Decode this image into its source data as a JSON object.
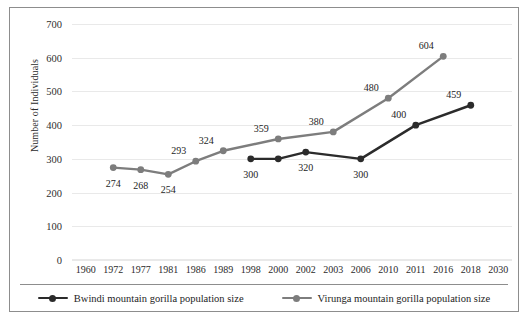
{
  "chart_data": {
    "type": "line",
    "title": "",
    "xlabel": "",
    "ylabel": "Number of Individuals",
    "categories": [
      "1960",
      "1972",
      "1977",
      "1981",
      "1986",
      "1989",
      "1998",
      "2000",
      "2002",
      "2003",
      "2006",
      "2010",
      "2011",
      "2016",
      "2018",
      "2030"
    ],
    "ylim": [
      0,
      700
    ],
    "ytick_step": 100,
    "yticks": [
      "700",
      "600",
      "500",
      "400",
      "300",
      "200",
      "100",
      "0"
    ],
    "grid": true,
    "legend_position": "bottom",
    "series": [
      {
        "name": "Bwindi mountain gorilla population size",
        "color": "#2b2b2b",
        "points": [
          {
            "x": "1998",
            "y": 300,
            "label": "300",
            "label_pos": "below"
          },
          {
            "x": "2000",
            "y": 300,
            "label": "",
            "label_pos": "below"
          },
          {
            "x": "2002",
            "y": 320,
            "label": "320",
            "label_pos": "below"
          },
          {
            "x": "2006",
            "y": 300,
            "label": "300",
            "label_pos": "below"
          },
          {
            "x": "2011",
            "y": 400,
            "label": "400",
            "label_pos": "above-left"
          },
          {
            "x": "2018",
            "y": 459,
            "label": "459",
            "label_pos": "above-left"
          }
        ]
      },
      {
        "name": "Virunga mountain gorilla population size",
        "color": "#7d7d7d",
        "points": [
          {
            "x": "1972",
            "y": 274,
            "label": "274",
            "label_pos": "below"
          },
          {
            "x": "1977",
            "y": 268,
            "label": "268",
            "label_pos": "below"
          },
          {
            "x": "1981",
            "y": 254,
            "label": "254",
            "label_pos": "below"
          },
          {
            "x": "1986",
            "y": 293,
            "label": "293",
            "label_pos": "above-left"
          },
          {
            "x": "1989",
            "y": 324,
            "label": "324",
            "label_pos": "above-left"
          },
          {
            "x": "2000",
            "y": 359,
            "label": "359",
            "label_pos": "above-left"
          },
          {
            "x": "2003",
            "y": 380,
            "label": "380",
            "label_pos": "above-left"
          },
          {
            "x": "2010",
            "y": 480,
            "label": "480",
            "label_pos": "above-left"
          },
          {
            "x": "2016",
            "y": 604,
            "label": "604",
            "label_pos": "above-left"
          }
        ]
      }
    ]
  },
  "legend": {
    "items": [
      {
        "label": "Bwindi mountain gorilla population size",
        "color": "#2b2b2b"
      },
      {
        "label": "Virunga mountain gorilla population size",
        "color": "#7d7d7d"
      }
    ]
  }
}
